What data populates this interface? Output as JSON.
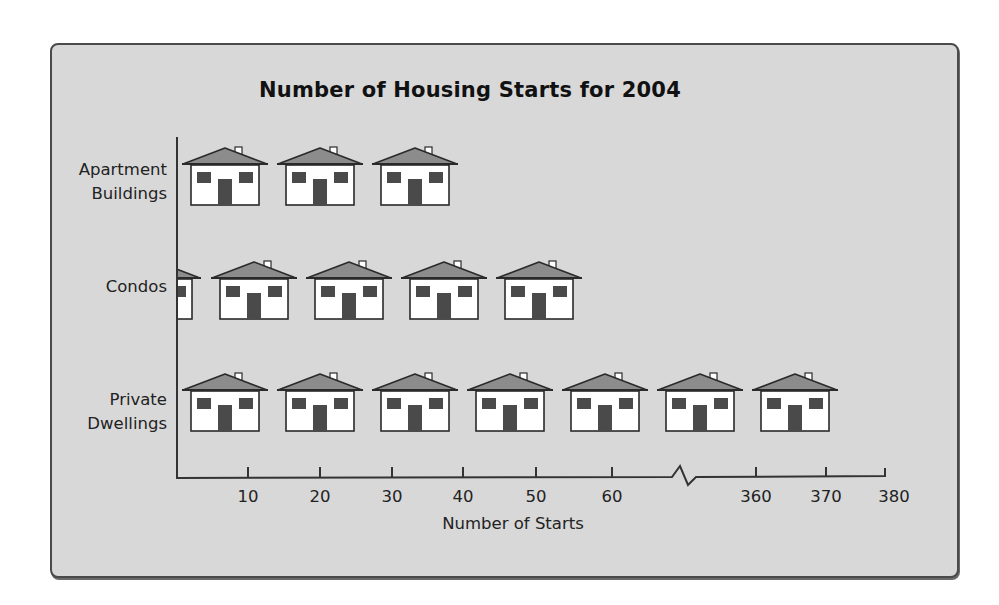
{
  "chart_data": {
    "type": "pictograph",
    "title": "Number of Housing Starts for 2004",
    "xlabel": "Number of Starts",
    "ylabel": "",
    "categories": [
      "Apartment Buildings",
      "Condos",
      "Private Dwellings"
    ],
    "category_lines": [
      [
        "Apartment",
        "Buildings"
      ],
      [
        "Condos"
      ],
      [
        "Private",
        "Dwellings"
      ]
    ],
    "symbol": "house",
    "symbol_counts": [
      3,
      4.2,
      7
    ],
    "x_ticks": [
      {
        "label": "10",
        "x": 248
      },
      {
        "label": "20",
        "x": 320
      },
      {
        "label": "30",
        "x": 392
      },
      {
        "label": "40",
        "x": 463
      },
      {
        "label": "50",
        "x": 536
      },
      {
        "label": "60",
        "x": 612
      },
      {
        "label": "360",
        "x": 756
      },
      {
        "label": "370",
        "x": 826
      },
      {
        "label": "380",
        "x": 894
      }
    ],
    "axis_break": {
      "between": [
        "60",
        "360"
      ]
    },
    "xlim": [
      0,
      380
    ],
    "grid": false,
    "legend": null,
    "rows": [
      {
        "name": "Apartment Buildings",
        "top": 143,
        "houses": [
          3,
          98,
          193
        ],
        "partial": null
      },
      {
        "name": "Condos",
        "top": 257,
        "houses": [
          32,
          127,
          222,
          317
        ],
        "partial": -64
      },
      {
        "name": "Private Dwellings",
        "top": 369,
        "houses": [
          3,
          98,
          193,
          288,
          383,
          478,
          573
        ],
        "partial": null
      }
    ]
  },
  "colors": {
    "background": "#d8d8d8",
    "frame_border": "#4a4a4a",
    "roof": "#8c8c8c",
    "house_body": "#ffffff",
    "window_door": "#4a4a4a",
    "outline": "#2a2a2a"
  }
}
